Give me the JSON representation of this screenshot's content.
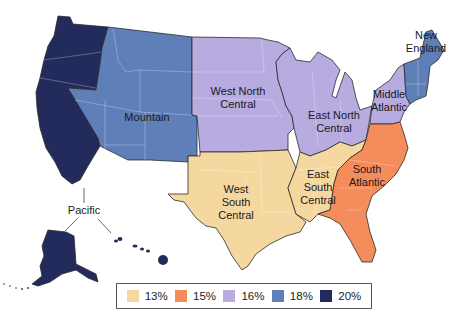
{
  "map": {
    "type": "choropleth",
    "subject": "US Census Divisions",
    "regions": [
      {
        "name": "Pacific",
        "value": "20%",
        "color": "#232b5c"
      },
      {
        "name": "Mountain",
        "value": "18%",
        "color": "#5f7fb8"
      },
      {
        "name": "West North Central",
        "value": "16%",
        "color": "#b7abe0"
      },
      {
        "name": "East North Central",
        "value": "16%",
        "color": "#b7abe0"
      },
      {
        "name": "Middle Atlantic",
        "value": "16%",
        "color": "#b7abe0"
      },
      {
        "name": "New England",
        "value": "18%",
        "color": "#5f7fb8"
      },
      {
        "name": "West South Central",
        "value": "13%",
        "color": "#f5d8a0"
      },
      {
        "name": "East South Central",
        "value": "13%",
        "color": "#f5d8a0"
      },
      {
        "name": "South Atlantic",
        "value": "15%",
        "color": "#f58c5c"
      }
    ]
  },
  "labels": {
    "pacific": "Pacific",
    "mountain": "Mountain",
    "wnc": "West North\nCentral",
    "enc": "East North\nCentral",
    "mid_atlantic": "Middle\nAtlantic",
    "new_england": "New\nEngland",
    "wsc": "West\nSouth\nCentral",
    "esc": "East\nSouth\nCentral",
    "south_atlantic": "South\nAtlantic"
  },
  "legend": {
    "items": [
      {
        "label": "13%",
        "color": "#f5d8a0"
      },
      {
        "label": "15%",
        "color": "#f58c5c"
      },
      {
        "label": "16%",
        "color": "#b7abe0"
      },
      {
        "label": "18%",
        "color": "#5f7fb8"
      },
      {
        "label": "20%",
        "color": "#232b5c"
      }
    ]
  }
}
